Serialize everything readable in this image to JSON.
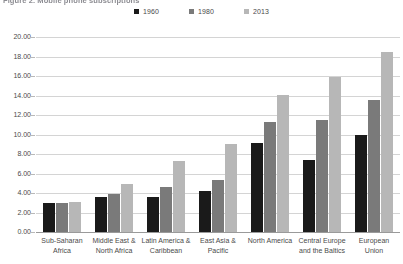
{
  "chart_data": {
    "type": "bar",
    "title": "Figure 2. Mobile phone subscriptions",
    "xlabel": "",
    "ylabel": "",
    "ylim": [
      0,
      20
    ],
    "ytick_step": 2,
    "ytick_labels": [
      "0.00",
      "2.00",
      "4.00",
      "6.00",
      "8.00",
      "10.00",
      "12.00",
      "14.00",
      "16.00",
      "18.00",
      "20.00"
    ],
    "grid": true,
    "legend_position": "top-center",
    "categories": [
      "Sub-Saharan Africa",
      "Middle East & North Africa",
      "Latin America & Caribbean",
      "East Asia & Pacific",
      "North America",
      "Central Europe and the Baltics",
      "European Union"
    ],
    "category_lines": [
      [
        "Sub-Saharan",
        "Africa"
      ],
      [
        "Middle East &",
        "North Africa"
      ],
      [
        "Latin America &",
        "Caribbean"
      ],
      [
        "East Asia &",
        "Pacific"
      ],
      [
        "North America",
        ""
      ],
      [
        "Central Europe",
        "and the Baltics"
      ],
      [
        "European Union",
        ""
      ]
    ],
    "series": [
      {
        "name": "1960",
        "color": "#1a1a1a",
        "values": [
          3.0,
          3.6,
          3.6,
          4.2,
          9.1,
          7.4,
          10.0
        ]
      },
      {
        "name": "1980",
        "color": "#7a7a7a",
        "values": [
          3.0,
          3.9,
          4.6,
          5.3,
          11.3,
          11.5,
          13.5
        ]
      },
      {
        "name": "2013",
        "color": "#b7b7b7",
        "values": [
          3.1,
          4.9,
          7.3,
          9.0,
          14.1,
          15.9,
          18.5
        ]
      }
    ]
  }
}
